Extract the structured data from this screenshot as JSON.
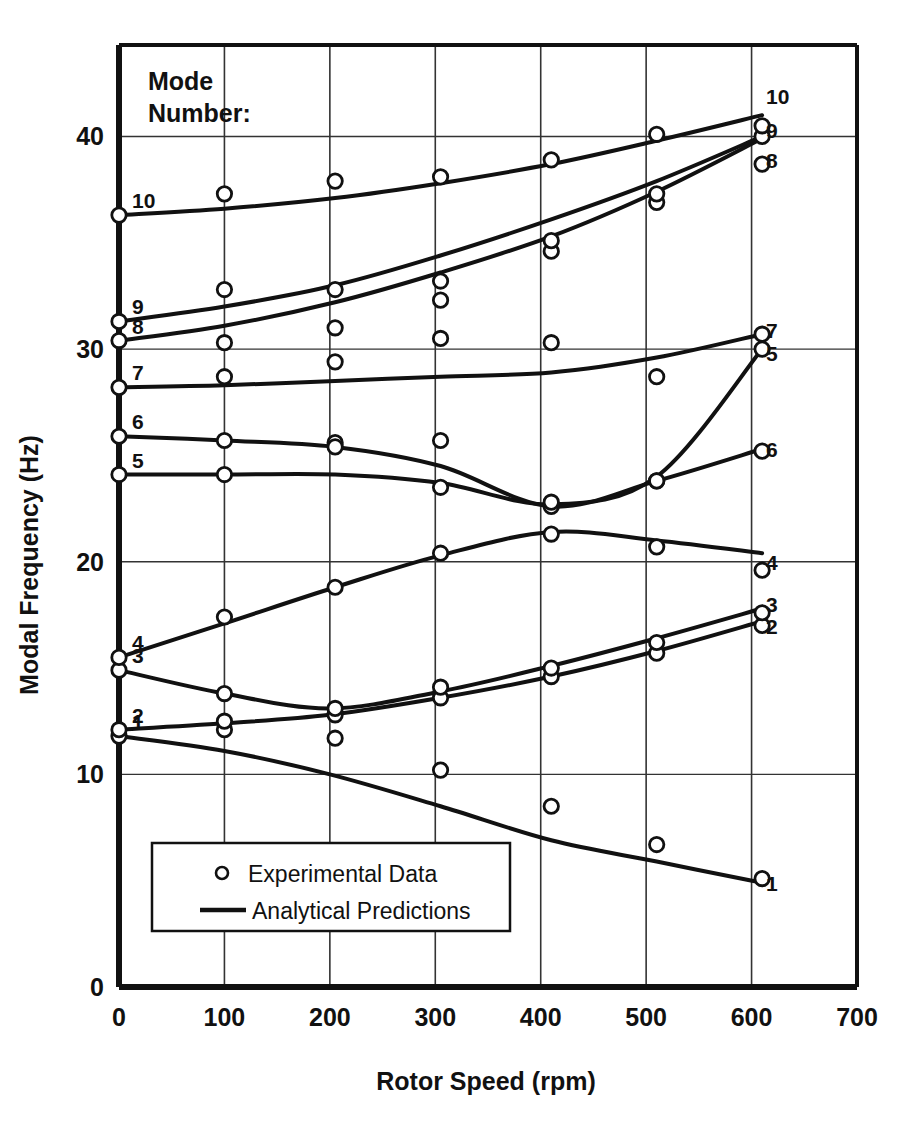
{
  "chart_data": {
    "type": "line",
    "title": "",
    "xlabel": "Rotor Speed (rpm)",
    "ylabel": "Modal Frequency (Hz)",
    "xlim": [
      0,
      700
    ],
    "ylim": [
      0,
      44.3
    ],
    "xticks": [
      0,
      100,
      200,
      300,
      400,
      500,
      600,
      700
    ],
    "yticks": [
      0,
      10,
      20,
      30,
      40
    ],
    "xtick_labels": [
      "0",
      "100",
      "200",
      "300",
      "400",
      "500",
      "600",
      "700"
    ],
    "ytick_labels": [
      "0",
      "10",
      "20",
      "30",
      "40"
    ],
    "grid": true,
    "legend_position": "bottom-left-inside",
    "legend": [
      {
        "marker": "circle-open",
        "label": "Experimental Data"
      },
      {
        "marker": "line",
        "label": "Analytical Predictions"
      }
    ],
    "annotation": "Mode\nNumber:",
    "annotation_lines": [
      "Mode",
      "Number:"
    ],
    "series": [
      {
        "name": "1",
        "left_label": "1",
        "right_label": "1",
        "line": [
          [
            0,
            11.8
          ],
          [
            100,
            11.1
          ],
          [
            200,
            10.0
          ],
          [
            305,
            8.5
          ],
          [
            410,
            6.9
          ],
          [
            510,
            5.9
          ],
          [
            610,
            4.9
          ]
        ],
        "points": [
          [
            0,
            11.8
          ],
          [
            100,
            12.1
          ],
          [
            205,
            11.7
          ],
          [
            305,
            10.2
          ],
          [
            410,
            8.5
          ],
          [
            510,
            6.7
          ],
          [
            610,
            5.1
          ]
        ]
      },
      {
        "name": "2",
        "left_label": "2",
        "right_label": "2",
        "line": [
          [
            0,
            12.1
          ],
          [
            100,
            12.4
          ],
          [
            200,
            12.8
          ],
          [
            305,
            13.6
          ],
          [
            410,
            14.6
          ],
          [
            510,
            15.8
          ],
          [
            610,
            17.2
          ]
        ],
        "points": [
          [
            0,
            12.1
          ],
          [
            100,
            12.5
          ],
          [
            205,
            12.8
          ],
          [
            305,
            13.6
          ],
          [
            410,
            14.6
          ],
          [
            510,
            15.7
          ],
          [
            610,
            17.0
          ]
        ]
      },
      {
        "name": "3",
        "left_label": "3",
        "right_label": "3",
        "line": [
          [
            0,
            14.9
          ],
          [
            100,
            13.8
          ],
          [
            200,
            13.1
          ],
          [
            305,
            13.9
          ],
          [
            410,
            15.1
          ],
          [
            510,
            16.4
          ],
          [
            610,
            17.8
          ]
        ],
        "points": [
          [
            0,
            14.9
          ],
          [
            100,
            13.8
          ],
          [
            205,
            13.1
          ],
          [
            305,
            14.1
          ],
          [
            410,
            15.0
          ],
          [
            510,
            16.2
          ],
          [
            610,
            17.6
          ]
        ]
      },
      {
        "name": "4",
        "left_label": "4",
        "right_label": "4",
        "line": [
          [
            0,
            15.5
          ],
          [
            100,
            17.1
          ],
          [
            205,
            18.8
          ],
          [
            305,
            20.3
          ],
          [
            410,
            21.4
          ],
          [
            510,
            21.0
          ],
          [
            610,
            20.4
          ]
        ],
        "points": [
          [
            0,
            15.5
          ],
          [
            100,
            17.4
          ],
          [
            205,
            18.8
          ],
          [
            305,
            20.4
          ],
          [
            410,
            21.3
          ],
          [
            510,
            20.7
          ],
          [
            610,
            19.6
          ]
        ]
      },
      {
        "name": "5",
        "left_label": "5",
        "right_label": "5",
        "line": [
          [
            0,
            24.1
          ],
          [
            100,
            24.1
          ],
          [
            205,
            24.1
          ],
          [
            305,
            23.7
          ],
          [
            410,
            22.7
          ],
          [
            510,
            24.0
          ],
          [
            610,
            30.0
          ]
        ],
        "points": [
          [
            0,
            24.1
          ],
          [
            100,
            24.1
          ],
          [
            205,
            25.6
          ],
          [
            305,
            23.5
          ],
          [
            410,
            22.6
          ],
          [
            510,
            23.8
          ],
          [
            610,
            30.0
          ]
        ]
      },
      {
        "name": "6",
        "left_label": "6",
        "right_label": "6",
        "line": [
          [
            0,
            25.9
          ],
          [
            100,
            25.7
          ],
          [
            205,
            25.4
          ],
          [
            305,
            24.5
          ],
          [
            410,
            22.6
          ],
          [
            510,
            23.8
          ],
          [
            610,
            25.3
          ]
        ],
        "points": [
          [
            0,
            25.9
          ],
          [
            100,
            25.7
          ],
          [
            205,
            25.4
          ],
          [
            305,
            25.7
          ],
          [
            410,
            22.8
          ],
          [
            510,
            23.8
          ],
          [
            610,
            25.2
          ]
        ]
      },
      {
        "name": "7",
        "left_label": "7",
        "right_label": "7",
        "line": [
          [
            0,
            28.2
          ],
          [
            100,
            28.3
          ],
          [
            205,
            28.5
          ],
          [
            305,
            28.7
          ],
          [
            410,
            28.9
          ],
          [
            510,
            29.6
          ],
          [
            610,
            30.7
          ]
        ],
        "points": [
          [
            0,
            28.2
          ],
          [
            100,
            28.7
          ],
          [
            205,
            29.4
          ],
          [
            305,
            30.5
          ],
          [
            410,
            30.3
          ],
          [
            510,
            28.7
          ],
          [
            610,
            30.7
          ]
        ]
      },
      {
        "name": "8",
        "left_label": "8",
        "right_label": "8",
        "line": [
          [
            0,
            30.4
          ],
          [
            100,
            31.1
          ],
          [
            205,
            32.2
          ],
          [
            305,
            33.6
          ],
          [
            410,
            35.3
          ],
          [
            510,
            37.4
          ],
          [
            610,
            39.9
          ]
        ],
        "points": [
          [
            0,
            30.4
          ],
          [
            100,
            30.3
          ],
          [
            205,
            31.0
          ],
          [
            305,
            32.3
          ],
          [
            410,
            34.6
          ],
          [
            510,
            36.9
          ],
          [
            610,
            38.7
          ]
        ]
      },
      {
        "name": "9",
        "left_label": "9",
        "right_label": "9",
        "line": [
          [
            0,
            31.3
          ],
          [
            100,
            32.0
          ],
          [
            205,
            33.0
          ],
          [
            305,
            34.4
          ],
          [
            410,
            36.1
          ],
          [
            510,
            37.9
          ],
          [
            610,
            40.0
          ]
        ],
        "points": [
          [
            0,
            31.3
          ],
          [
            100,
            32.8
          ],
          [
            205,
            32.8
          ],
          [
            305,
            33.2
          ],
          [
            410,
            35.1
          ],
          [
            510,
            37.3
          ],
          [
            610,
            40.0
          ]
        ]
      },
      {
        "name": "10",
        "left_label": "10",
        "right_label": "10",
        "line": [
          [
            0,
            36.3
          ],
          [
            100,
            36.6
          ],
          [
            205,
            37.1
          ],
          [
            305,
            37.8
          ],
          [
            410,
            38.7
          ],
          [
            510,
            39.8
          ],
          [
            610,
            41.0
          ]
        ],
        "points": [
          [
            0,
            36.3
          ],
          [
            100,
            37.3
          ],
          [
            205,
            37.9
          ],
          [
            305,
            38.1
          ],
          [
            410,
            38.9
          ],
          [
            510,
            40.1
          ],
          [
            610,
            40.5
          ]
        ]
      }
    ]
  },
  "axes": {
    "x_title": "Rotor Speed (rpm)",
    "y_title": "Modal Frequency (Hz)"
  },
  "annotation": {
    "line1": "Mode",
    "line2": "Number:"
  },
  "legend": {
    "experimental": "Experimental Data",
    "analytical": "Analytical Predictions"
  },
  "colors": {
    "ink": "#111111",
    "grid": "#333333",
    "background": "#ffffff"
  },
  "mode_labels_left": [
    {
      "mode": "10",
      "hz": 36.3
    },
    {
      "mode": "9",
      "hz": 31.3
    },
    {
      "mode": "8",
      "hz": 30.4
    },
    {
      "mode": "7",
      "hz": 28.2
    },
    {
      "mode": "6",
      "hz": 25.9
    },
    {
      "mode": "5",
      "hz": 24.1
    },
    {
      "mode": "4",
      "hz": 15.5
    },
    {
      "mode": "3",
      "hz": 14.9
    },
    {
      "mode": "2",
      "hz": 12.1
    },
    {
      "mode": "1",
      "hz": 11.8
    }
  ],
  "mode_labels_right": [
    {
      "mode": "10",
      "hz": 41.9
    },
    {
      "mode": "9",
      "hz": 40.3
    },
    {
      "mode": "8",
      "hz": 38.9
    },
    {
      "mode": "7",
      "hz": 30.9
    },
    {
      "mode": "5",
      "hz": 29.8
    },
    {
      "mode": "6",
      "hz": 25.3
    },
    {
      "mode": "4",
      "hz": 20.0
    },
    {
      "mode": "3",
      "hz": 18.0
    },
    {
      "mode": "2",
      "hz": 17.0
    },
    {
      "mode": "1",
      "hz": 4.9
    }
  ]
}
